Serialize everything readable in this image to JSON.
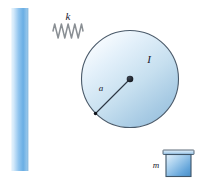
{
  "figure": {
    "type": "physics-mechanics-diagram",
    "canvas": {
      "width": 197,
      "height": 179,
      "background": "#ffffff"
    },
    "labels": {
      "spring_stiffness": "k",
      "moment_of_inertia": "I",
      "radius": "a",
      "mass": "m"
    },
    "colors": {
      "wall_light": "#d8ecfb",
      "wall_mid": "#7fb8e8",
      "wall_edge": "#5a9fd8",
      "disk_light": "#f2f8fd",
      "disk_mid": "#bcd9ef",
      "disk_edge": "#8fb8d8",
      "outline": "#4a5a6a",
      "cord": "#8a8f94",
      "spring": "#8a8f94",
      "block_light": "#cfe6f8",
      "block_mid": "#5d9fd6",
      "label_text": "#1a1a2e"
    },
    "geometry": {
      "wall": {
        "x": 12,
        "y": 8,
        "width": 16,
        "height": 163
      },
      "spring": {
        "x_start": 28,
        "x_end": 96,
        "y": 31,
        "coils": 9,
        "coil_start": 53,
        "coil_end": 83,
        "amplitude": 7
      },
      "disk": {
        "cx": 130,
        "cy": 79,
        "r": 48.5
      },
      "hub": {
        "cx": 130,
        "cy": 79,
        "r": 3.2
      },
      "radius_line": {
        "x1": 130,
        "y1": 79,
        "x2": 95.5,
        "y2": 113.5
      },
      "cord": {
        "x": 178.5,
        "y_start": 79,
        "y_end": 152
      },
      "block": {
        "x": 166,
        "y": 152,
        "width": 25,
        "height": 24,
        "lip_overhang": 3,
        "lip_height": 4
      }
    },
    "label_positions": {
      "k": {
        "x": 68,
        "y": 20
      },
      "I": {
        "x": 149,
        "y": 63
      },
      "a": {
        "x": 100,
        "y": 90
      },
      "m": {
        "x": 157,
        "y": 168
      }
    }
  }
}
